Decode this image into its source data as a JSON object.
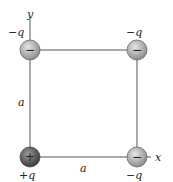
{
  "diagram": {
    "type": "charge-square",
    "axes": {
      "x_label": "x",
      "y_label": "y"
    },
    "side_labels": {
      "left": "a",
      "bottom": "a"
    },
    "charges": [
      {
        "position": "top-left",
        "sign": "−",
        "label": "−q"
      },
      {
        "position": "top-right",
        "sign": "−",
        "label": "−q"
      },
      {
        "position": "bottom-left",
        "sign": "+",
        "label": "+q"
      },
      {
        "position": "bottom-right",
        "sign": "−",
        "label": "−q"
      }
    ],
    "colors": {
      "line": "#555555",
      "negative_fill": "#b8b8b8",
      "positive_fill": "#6e6e6e"
    }
  }
}
